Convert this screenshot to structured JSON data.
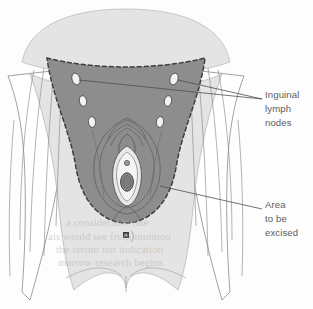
{
  "figure": {
    "background_color": "#fdfdfd"
  },
  "colors": {
    "skin_light": "#e2e2e2",
    "excision_fill": "#8d8d8d",
    "outline": "#6f6f6f",
    "dashed_border": "#4a4a4a",
    "node_fill": "#f2f2f2",
    "node_outline": "#4f4f4f",
    "leader_line": "#4e4e4e",
    "label_text": "#5c5c5c",
    "anus_mark": "#3a3a3a",
    "bleed_text": "#b9b4ae"
  },
  "labels": [
    {
      "id": "inguinal-lymph-nodes",
      "lines": [
        "Inguinal",
        "lymph",
        "nodes"
      ],
      "x": 265,
      "y": 98
    },
    {
      "id": "area-to-be-excised",
      "lines": [
        "Area",
        "to be",
        "excised"
      ],
      "x": 265,
      "y": 208
    }
  ],
  "anatomy": {
    "lymph_nodes_left": [
      {
        "cx": 76,
        "cy": 79,
        "rx": 4.0,
        "ry": 6.0,
        "angle": -18
      },
      {
        "cx": 83,
        "cy": 101,
        "rx": 3.6,
        "ry": 5.4,
        "angle": -12
      },
      {
        "cx": 92,
        "cy": 122,
        "rx": 3.6,
        "ry": 5.4,
        "angle": -8
      }
    ],
    "lymph_nodes_right": [
      {
        "cx": 174,
        "cy": 79,
        "rx": 4.0,
        "ry": 6.0,
        "angle": 18
      },
      {
        "cx": 168,
        "cy": 101,
        "rx": 3.6,
        "ry": 5.4,
        "angle": 12
      },
      {
        "cx": 160,
        "cy": 122,
        "rx": 3.6,
        "ry": 5.4,
        "angle": 8
      }
    ],
    "anus": {
      "cx": 126,
      "cy": 235,
      "r": 3.2
    },
    "vulva_center": {
      "cx": 127,
      "cy": 165
    }
  },
  "bleed_through_lines": [
    {
      "text": "eridae",
      "x": 108,
      "y": 18
    },
    {
      "text": "rotas to withstand more",
      "x": 72,
      "y": 31
    },
    {
      "text": "mallest effects to thing",
      "x": 70,
      "y": 45
    },
    {
      "text": "an isolated ultim",
      "x": 96,
      "y": 58
    },
    {
      "text": "a considerable rate",
      "x": 66,
      "y": 226
    },
    {
      "text": "ais would see from ninimou",
      "x": 48,
      "y": 240
    },
    {
      "text": "the serum nor indication",
      "x": 56,
      "y": 253
    },
    {
      "text": "marrow research begins",
      "x": 58,
      "y": 266
    }
  ]
}
